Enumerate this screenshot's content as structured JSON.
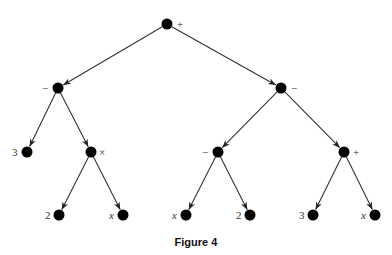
{
  "figure": {
    "caption": "Figure 4",
    "nodes": [
      {
        "id": "n0",
        "label": "+",
        "x": 167,
        "y": 24,
        "lx": 177,
        "ly": 28,
        "italic": false
      },
      {
        "id": "n1",
        "label": "−",
        "x": 58,
        "y": 88,
        "lx": 42,
        "ly": 92,
        "italic": false
      },
      {
        "id": "n2",
        "label": "−",
        "x": 281,
        "y": 88,
        "lx": 291,
        "ly": 92,
        "italic": false
      },
      {
        "id": "n3",
        "label": "3",
        "x": 27,
        "y": 152,
        "lx": 12,
        "ly": 156,
        "italic": false
      },
      {
        "id": "n4",
        "label": "×",
        "x": 91,
        "y": 152,
        "lx": 99,
        "ly": 156,
        "italic": false
      },
      {
        "id": "n5",
        "label": "−",
        "x": 218,
        "y": 152,
        "lx": 202,
        "ly": 156,
        "italic": false
      },
      {
        "id": "n6",
        "label": "+",
        "x": 344,
        "y": 152,
        "lx": 353,
        "ly": 156,
        "italic": false
      },
      {
        "id": "n7",
        "label": "2",
        "x": 59,
        "y": 215,
        "lx": 45,
        "ly": 219,
        "italic": false
      },
      {
        "id": "n8",
        "label": "x",
        "x": 123,
        "y": 215,
        "lx": 109,
        "ly": 219,
        "italic": true
      },
      {
        "id": "n9",
        "label": "x",
        "x": 186,
        "y": 215,
        "lx": 172,
        "ly": 219,
        "italic": true
      },
      {
        "id": "n10",
        "label": "2",
        "x": 250,
        "y": 215,
        "lx": 236,
        "ly": 219,
        "italic": false
      },
      {
        "id": "n11",
        "label": "3",
        "x": 313,
        "y": 215,
        "lx": 299,
        "ly": 219,
        "italic": false
      },
      {
        "id": "n12",
        "label": "x",
        "x": 375,
        "y": 215,
        "lx": 361,
        "ly": 219,
        "italic": true
      }
    ],
    "edges": [
      [
        "n0",
        "n1"
      ],
      [
        "n0",
        "n2"
      ],
      [
        "n1",
        "n3"
      ],
      [
        "n1",
        "n4"
      ],
      [
        "n4",
        "n7"
      ],
      [
        "n4",
        "n8"
      ],
      [
        "n2",
        "n5"
      ],
      [
        "n2",
        "n6"
      ],
      [
        "n5",
        "n9"
      ],
      [
        "n5",
        "n10"
      ],
      [
        "n6",
        "n11"
      ],
      [
        "n6",
        "n12"
      ]
    ]
  }
}
